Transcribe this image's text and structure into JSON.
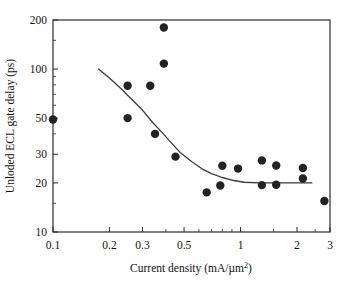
{
  "chart_data": {
    "type": "scatter",
    "title": "",
    "xlabel": "Current density (mA/µm²)",
    "ylabel": "Unloded ECL gate delay (ps)",
    "xscale": "log",
    "yscale": "log",
    "xlim": [
      0.1,
      3
    ],
    "ylim": [
      10,
      200
    ],
    "grid": false,
    "legend": null,
    "xticks": [
      {
        "value": 0.1,
        "label": "0.1"
      },
      {
        "value": 0.2,
        "label": "0.2"
      },
      {
        "value": 0.3,
        "label": "0.3"
      },
      {
        "value": 0.5,
        "label": "0.5"
      },
      {
        "value": 1,
        "label": "1"
      },
      {
        "value": 2,
        "label": "2"
      },
      {
        "value": 3,
        "label": "3"
      }
    ],
    "yticks": [
      {
        "value": 10,
        "label": "10"
      },
      {
        "value": 20,
        "label": "20"
      },
      {
        "value": 30,
        "label": "30"
      },
      {
        "value": 50,
        "label": "50"
      },
      {
        "value": 100,
        "label": "100"
      },
      {
        "value": 200,
        "label": "200"
      }
    ],
    "x_minor_ticks": [
      0.4,
      0.6,
      0.7,
      0.8,
      0.9,
      1.5,
      2.5
    ],
    "y_minor_ticks": [
      15,
      40,
      60,
      70,
      80,
      90,
      150
    ],
    "marker": {
      "shape": "circle",
      "size": 4.2,
      "color": "#232323"
    },
    "points": [
      {
        "x": 0.1,
        "y": 49
      },
      {
        "x": 0.25,
        "y": 79
      },
      {
        "x": 0.25,
        "y": 50
      },
      {
        "x": 0.33,
        "y": 79
      },
      {
        "x": 0.35,
        "y": 40
      },
      {
        "x": 0.39,
        "y": 180
      },
      {
        "x": 0.39,
        "y": 108
      },
      {
        "x": 0.45,
        "y": 29
      },
      {
        "x": 0.66,
        "y": 17.5
      },
      {
        "x": 0.78,
        "y": 19.3
      },
      {
        "x": 0.8,
        "y": 25.5
      },
      {
        "x": 0.97,
        "y": 24.5
      },
      {
        "x": 1.3,
        "y": 27.5
      },
      {
        "x": 1.3,
        "y": 19.4
      },
      {
        "x": 1.55,
        "y": 25.6
      },
      {
        "x": 1.55,
        "y": 19.5
      },
      {
        "x": 2.15,
        "y": 24.7
      },
      {
        "x": 2.15,
        "y": 21.3
      },
      {
        "x": 2.8,
        "y": 15.5
      }
    ],
    "fit_curve": {
      "name": "fitted trend",
      "color": "#3a3a3a",
      "points": [
        {
          "x": 0.175,
          "y": 100
        },
        {
          "x": 0.2,
          "y": 88
        },
        {
          "x": 0.23,
          "y": 76
        },
        {
          "x": 0.26,
          "y": 66
        },
        {
          "x": 0.3,
          "y": 56
        },
        {
          "x": 0.34,
          "y": 47
        },
        {
          "x": 0.38,
          "y": 41
        },
        {
          "x": 0.43,
          "y": 35
        },
        {
          "x": 0.48,
          "y": 30.5
        },
        {
          "x": 0.55,
          "y": 27
        },
        {
          "x": 0.62,
          "y": 24.5
        },
        {
          "x": 0.7,
          "y": 22.8
        },
        {
          "x": 0.8,
          "y": 21.6
        },
        {
          "x": 0.92,
          "y": 20.7
        },
        {
          "x": 1.05,
          "y": 20.2
        },
        {
          "x": 1.25,
          "y": 20.0
        },
        {
          "x": 1.6,
          "y": 20.0
        },
        {
          "x": 2.0,
          "y": 20.0
        },
        {
          "x": 2.4,
          "y": 20.0
        }
      ]
    }
  }
}
